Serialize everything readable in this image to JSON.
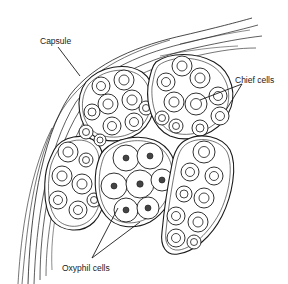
{
  "figure": {
    "labels": {
      "capsule": "Capsule",
      "chief_cells": "Chief cells",
      "oxyphil_cells": "Oxyphil cells"
    },
    "colors": {
      "ink": "#1a1a1a",
      "background": "#ffffff"
    }
  }
}
